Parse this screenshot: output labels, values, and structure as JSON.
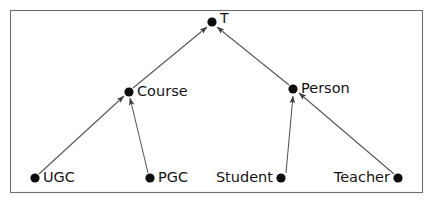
{
  "diagram": {
    "type": "directed-graph",
    "frame": {
      "x": 10.5,
      "y": 10.5,
      "width": 412,
      "height": 182,
      "stroke": "#6e6e6e"
    },
    "colors": {
      "node_fill": "#0d0d0d",
      "edge_stroke": "#545454",
      "label_fill": "#141414",
      "background": "#ffffff"
    },
    "nodes": [
      {
        "id": "top",
        "label": "T",
        "x": 212,
        "y": 22,
        "r": 4.6,
        "label_x": 220,
        "label_y": 19,
        "anchor": "start",
        "symbol": "top-type-symbol"
      },
      {
        "id": "course",
        "label": "Course",
        "x": 129,
        "y": 92,
        "r": 4.6,
        "label_x": 137,
        "label_y": 92,
        "anchor": "start",
        "symbol": "course-node"
      },
      {
        "id": "person",
        "label": "Person",
        "x": 293,
        "y": 89,
        "r": 4.6,
        "label_x": 301,
        "label_y": 89,
        "anchor": "start",
        "symbol": "person-node"
      },
      {
        "id": "ugc",
        "label": "UGC",
        "x": 35,
        "y": 178,
        "r": 4.6,
        "label_x": 43,
        "label_y": 178,
        "anchor": "start",
        "symbol": "ugc-node"
      },
      {
        "id": "pgc",
        "label": "PGC",
        "x": 150,
        "y": 178,
        "r": 4.6,
        "label_x": 158,
        "label_y": 178,
        "anchor": "start",
        "symbol": "pgc-node"
      },
      {
        "id": "student",
        "label": "Student",
        "x": 281,
        "y": 178,
        "r": 4.6,
        "label_x": 273,
        "label_y": 178,
        "anchor": "end",
        "symbol": "student-node"
      },
      {
        "id": "teacher",
        "label": "Teacher",
        "x": 398,
        "y": 178,
        "r": 4.6,
        "label_x": 390,
        "label_y": 178,
        "anchor": "end",
        "symbol": "teacher-node"
      }
    ],
    "edges": [
      {
        "id": "course-to-top",
        "from": "course",
        "to": "top",
        "arrow": "to",
        "x1": 133,
        "y1": 88,
        "x2": 207,
        "y2": 27
      },
      {
        "id": "person-to-top",
        "from": "person",
        "to": "top",
        "arrow": "to",
        "x1": 289,
        "y1": 85,
        "x2": 217,
        "y2": 27
      },
      {
        "id": "ugc-to-course",
        "from": "ugc",
        "to": "course",
        "arrow": "to",
        "x1": 39,
        "y1": 174,
        "x2": 124,
        "y2": 96
      },
      {
        "id": "pgc-to-course",
        "from": "pgc",
        "to": "course",
        "arrow": "to",
        "x1": 148,
        "y1": 173,
        "x2": 130,
        "y2": 98
      },
      {
        "id": "student-to-person",
        "from": "student",
        "to": "person",
        "arrow": "to",
        "x1": 286,
        "y1": 173,
        "x2": 293,
        "y2": 96
      },
      {
        "id": "teacher-to-person",
        "from": "teacher",
        "to": "person",
        "arrow": "to",
        "x1": 394,
        "y1": 174,
        "x2": 299,
        "y2": 93
      }
    ]
  }
}
